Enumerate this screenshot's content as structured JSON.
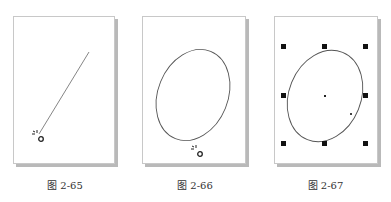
{
  "figures": [
    {
      "caption": "图 2-65",
      "content": "diagonal-line",
      "cursor": "ellipse-tool-cursor-icon"
    },
    {
      "caption": "图 2-66",
      "content": "ellipse",
      "cursor": "ellipse-tool-cursor-icon"
    },
    {
      "caption": "图 2-67",
      "content": "selected-ellipse",
      "selection_handles": 8,
      "center_marker": true
    }
  ],
  "colors": {
    "page_border": "#c8c8c8",
    "page_shadow": "#b9b9b9",
    "stroke": "#555555",
    "handle": "#111111"
  }
}
